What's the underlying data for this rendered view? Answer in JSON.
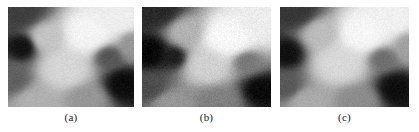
{
  "figure": {
    "background_color": "#ffffff",
    "panel_count": 3,
    "panel_width_px": 128,
    "panel_height_px": 100
  },
  "panels": [
    {
      "id": "panel-a",
      "caption": "(a)",
      "colormap": "grayscale",
      "value_range": [
        0,
        255
      ],
      "noise_amount": 0.055,
      "blur_px": 0.6,
      "blobs": [
        {
          "cx": 0.09,
          "cy": 0.04,
          "rx": 0.3,
          "ry": 0.26,
          "level": 62
        },
        {
          "cx": 0.11,
          "cy": 0.4,
          "rx": 0.17,
          "ry": 0.19,
          "level": 18
        },
        {
          "cx": 0.03,
          "cy": 0.72,
          "rx": 0.2,
          "ry": 0.24,
          "level": 96
        },
        {
          "cx": 0.31,
          "cy": 0.3,
          "rx": 0.22,
          "ry": 0.24,
          "level": 196
        },
        {
          "cx": 0.45,
          "cy": 0.62,
          "rx": 0.26,
          "ry": 0.28,
          "level": 214
        },
        {
          "cx": 0.63,
          "cy": 0.26,
          "rx": 0.3,
          "ry": 0.3,
          "level": 244
        },
        {
          "cx": 0.88,
          "cy": 0.12,
          "rx": 0.24,
          "ry": 0.22,
          "level": 238
        },
        {
          "cx": 0.8,
          "cy": 0.5,
          "rx": 0.16,
          "ry": 0.17,
          "level": 86
        },
        {
          "cx": 0.92,
          "cy": 0.78,
          "rx": 0.2,
          "ry": 0.22,
          "level": 12
        },
        {
          "cx": 0.62,
          "cy": 0.92,
          "rx": 0.24,
          "ry": 0.2,
          "level": 150
        },
        {
          "cx": 0.22,
          "cy": 0.95,
          "rx": 0.26,
          "ry": 0.22,
          "level": 176
        },
        {
          "cx": 0.98,
          "cy": 0.38,
          "rx": 0.14,
          "ry": 0.2,
          "level": 150
        }
      ]
    },
    {
      "id": "panel-b",
      "caption": "(b)",
      "colormap": "grayscale",
      "value_range": [
        0,
        255
      ],
      "noise_amount": 0.065,
      "blur_px": 0.5,
      "blobs": [
        {
          "cx": 0.1,
          "cy": 0.03,
          "rx": 0.32,
          "ry": 0.26,
          "level": 40
        },
        {
          "cx": 0.06,
          "cy": 0.45,
          "rx": 0.2,
          "ry": 0.22,
          "level": 8
        },
        {
          "cx": 0.24,
          "cy": 0.5,
          "rx": 0.15,
          "ry": 0.16,
          "level": 30
        },
        {
          "cx": 0.05,
          "cy": 0.82,
          "rx": 0.22,
          "ry": 0.24,
          "level": 76
        },
        {
          "cx": 0.34,
          "cy": 0.24,
          "rx": 0.22,
          "ry": 0.24,
          "level": 178
        },
        {
          "cx": 0.5,
          "cy": 0.58,
          "rx": 0.24,
          "ry": 0.26,
          "level": 208
        },
        {
          "cx": 0.66,
          "cy": 0.3,
          "rx": 0.3,
          "ry": 0.3,
          "level": 248
        },
        {
          "cx": 0.9,
          "cy": 0.14,
          "rx": 0.24,
          "ry": 0.22,
          "level": 236
        },
        {
          "cx": 0.82,
          "cy": 0.55,
          "rx": 0.16,
          "ry": 0.16,
          "level": 120
        },
        {
          "cx": 0.93,
          "cy": 0.84,
          "rx": 0.2,
          "ry": 0.2,
          "level": 10
        },
        {
          "cx": 0.58,
          "cy": 0.94,
          "rx": 0.26,
          "ry": 0.2,
          "level": 128
        },
        {
          "cx": 0.22,
          "cy": 0.96,
          "rx": 0.26,
          "ry": 0.2,
          "level": 150
        }
      ]
    },
    {
      "id": "panel-c",
      "caption": "(c)",
      "colormap": "grayscale",
      "value_range": [
        0,
        255
      ],
      "noise_amount": 0.05,
      "blur_px": 0.7,
      "blobs": [
        {
          "cx": 0.1,
          "cy": 0.04,
          "rx": 0.3,
          "ry": 0.25,
          "level": 54
        },
        {
          "cx": 0.05,
          "cy": 0.46,
          "rx": 0.18,
          "ry": 0.2,
          "level": 16
        },
        {
          "cx": 0.04,
          "cy": 0.8,
          "rx": 0.2,
          "ry": 0.22,
          "level": 88
        },
        {
          "cx": 0.32,
          "cy": 0.26,
          "rx": 0.22,
          "ry": 0.24,
          "level": 188
        },
        {
          "cx": 0.46,
          "cy": 0.56,
          "rx": 0.26,
          "ry": 0.28,
          "level": 216
        },
        {
          "cx": 0.64,
          "cy": 0.26,
          "rx": 0.3,
          "ry": 0.3,
          "level": 246
        },
        {
          "cx": 0.88,
          "cy": 0.12,
          "rx": 0.24,
          "ry": 0.22,
          "level": 240
        },
        {
          "cx": 0.8,
          "cy": 0.52,
          "rx": 0.16,
          "ry": 0.17,
          "level": 110
        },
        {
          "cx": 0.9,
          "cy": 0.82,
          "rx": 0.2,
          "ry": 0.22,
          "level": 14
        },
        {
          "cx": 0.6,
          "cy": 0.93,
          "rx": 0.24,
          "ry": 0.2,
          "level": 140
        },
        {
          "cx": 0.22,
          "cy": 0.95,
          "rx": 0.26,
          "ry": 0.22,
          "level": 170
        },
        {
          "cx": 0.99,
          "cy": 0.4,
          "rx": 0.14,
          "ry": 0.2,
          "level": 160
        }
      ]
    }
  ]
}
